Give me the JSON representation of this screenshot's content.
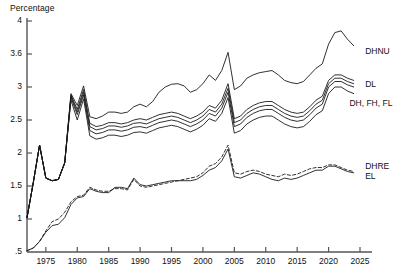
{
  "chart_data": {
    "type": "line",
    "title": "Percentage",
    "xlabel": "",
    "ylabel": "Percentage",
    "grid": false,
    "legend_position": "right-inline",
    "xlim": [
      1972,
      2025
    ],
    "ylim": [
      0.5,
      4.0
    ],
    "y_scale": "non-linear (equal pixel spacing per labelled tick)",
    "yticks": [
      0.5,
      1,
      1.5,
      2,
      2.5,
      3,
      3.6,
      4
    ],
    "ytick_labels": [
      ".5",
      "1",
      "1.5",
      "2",
      "2.5",
      "3",
      "3.6",
      "4"
    ],
    "xticks": [
      1975,
      1980,
      1985,
      1990,
      1995,
      2000,
      2005,
      2010,
      2015,
      2020,
      2025
    ],
    "xtick_labels": [
      "1975",
      "1980",
      "1985",
      "1990",
      "1995",
      "2000",
      "2005",
      "2010",
      "2015",
      "2020",
      "2025"
    ],
    "x": [
      1972,
      1973,
      1974,
      1975,
      1976,
      1977,
      1978,
      1979,
      1980,
      1981,
      1982,
      1983,
      1984,
      1985,
      1986,
      1987,
      1988,
      1989,
      1990,
      1991,
      1992,
      1993,
      1994,
      1995,
      1996,
      1997,
      1998,
      1999,
      2000,
      2001,
      2002,
      2003,
      2004,
      2005,
      2006,
      2007,
      2008,
      2009,
      2010,
      2011,
      2012,
      2013,
      2014,
      2015,
      2016,
      2017,
      2018,
      2019,
      2020,
      2021,
      2022,
      2023,
      2024
    ],
    "series": [
      {
        "name": "DHNU",
        "label": "DHNU",
        "style": "solid",
        "values": [
          1.02,
          1.55,
          2.12,
          1.62,
          1.58,
          1.6,
          1.85,
          2.9,
          2.72,
          3.02,
          2.55,
          2.52,
          2.56,
          2.62,
          2.62,
          2.6,
          2.62,
          2.7,
          2.74,
          2.7,
          2.78,
          2.92,
          3.0,
          3.05,
          3.06,
          3.02,
          2.92,
          2.96,
          3.06,
          3.22,
          3.12,
          3.3,
          3.62,
          2.96,
          3.02,
          3.16,
          3.22,
          3.26,
          3.28,
          3.3,
          3.22,
          3.12,
          3.08,
          3.06,
          3.1,
          3.22,
          3.34,
          3.42,
          3.72,
          3.86,
          3.88,
          3.78,
          3.7
        ]
      },
      {
        "name": "DL",
        "label": "DL",
        "style": "solid",
        "values": [
          1.02,
          1.55,
          2.12,
          1.62,
          1.58,
          1.6,
          1.85,
          2.88,
          2.66,
          2.96,
          2.45,
          2.4,
          2.42,
          2.46,
          2.46,
          2.44,
          2.46,
          2.5,
          2.52,
          2.5,
          2.54,
          2.58,
          2.6,
          2.62,
          2.6,
          2.56,
          2.52,
          2.56,
          2.62,
          2.72,
          2.68,
          2.8,
          3.06,
          2.52,
          2.56,
          2.66,
          2.72,
          2.76,
          2.78,
          2.78,
          2.72,
          2.66,
          2.62,
          2.6,
          2.62,
          2.7,
          2.8,
          2.86,
          3.12,
          3.22,
          3.22,
          3.16,
          3.12
        ]
      },
      {
        "name": "DH",
        "label": "DH, FH, FL",
        "style": "solid",
        "values": [
          1.02,
          1.55,
          2.12,
          1.62,
          1.58,
          1.6,
          1.85,
          2.86,
          2.62,
          2.92,
          2.4,
          2.35,
          2.37,
          2.41,
          2.41,
          2.39,
          2.41,
          2.45,
          2.46,
          2.44,
          2.48,
          2.52,
          2.54,
          2.56,
          2.54,
          2.5,
          2.46,
          2.5,
          2.56,
          2.66,
          2.62,
          2.74,
          2.98,
          2.46,
          2.5,
          2.6,
          2.66,
          2.7,
          2.72,
          2.72,
          2.66,
          2.6,
          2.56,
          2.54,
          2.56,
          2.64,
          2.74,
          2.8,
          3.06,
          3.16,
          3.16,
          3.1,
          3.06
        ]
      },
      {
        "name": "FH",
        "label": "",
        "style": "solid",
        "values": [
          1.02,
          1.55,
          2.12,
          1.62,
          1.58,
          1.6,
          1.85,
          2.84,
          2.58,
          2.88,
          2.34,
          2.29,
          2.31,
          2.35,
          2.35,
          2.33,
          2.35,
          2.39,
          2.4,
          2.38,
          2.42,
          2.46,
          2.48,
          2.5,
          2.48,
          2.44,
          2.4,
          2.44,
          2.5,
          2.6,
          2.56,
          2.68,
          2.92,
          2.4,
          2.44,
          2.54,
          2.6,
          2.64,
          2.66,
          2.66,
          2.6,
          2.54,
          2.5,
          2.48,
          2.5,
          2.58,
          2.68,
          2.74,
          3.0,
          3.1,
          3.1,
          3.04,
          3.0
        ]
      },
      {
        "name": "FL",
        "label": "",
        "style": "solid",
        "values": [
          1.02,
          1.55,
          2.12,
          1.62,
          1.58,
          1.6,
          1.85,
          2.8,
          2.5,
          2.82,
          2.26,
          2.21,
          2.23,
          2.27,
          2.27,
          2.25,
          2.27,
          2.31,
          2.32,
          2.3,
          2.34,
          2.38,
          2.4,
          2.42,
          2.4,
          2.36,
          2.32,
          2.36,
          2.42,
          2.52,
          2.48,
          2.6,
          2.84,
          2.3,
          2.34,
          2.44,
          2.5,
          2.54,
          2.56,
          2.56,
          2.5,
          2.44,
          2.4,
          2.38,
          2.4,
          2.48,
          2.58,
          2.64,
          2.9,
          3.0,
          3.0,
          2.94,
          2.9
        ]
      },
      {
        "name": "DHRE",
        "label": "DHRE",
        "style": "solid",
        "values": [
          0.52,
          0.56,
          0.66,
          0.8,
          0.9,
          0.92,
          1.02,
          1.22,
          1.32,
          1.34,
          1.46,
          1.42,
          1.4,
          1.4,
          1.48,
          1.48,
          1.46,
          1.62,
          1.52,
          1.5,
          1.52,
          1.54,
          1.56,
          1.58,
          1.58,
          1.58,
          1.58,
          1.6,
          1.66,
          1.74,
          1.78,
          1.88,
          2.06,
          1.64,
          1.62,
          1.66,
          1.7,
          1.68,
          1.64,
          1.6,
          1.58,
          1.62,
          1.6,
          1.62,
          1.66,
          1.7,
          1.74,
          1.74,
          1.8,
          1.8,
          1.76,
          1.72,
          1.7
        ]
      },
      {
        "name": "EL",
        "label": "EL",
        "style": "dashed",
        "values": [
          0.52,
          0.56,
          0.66,
          0.82,
          0.96,
          1.0,
          1.1,
          1.26,
          1.34,
          1.36,
          1.48,
          1.44,
          1.42,
          1.42,
          1.46,
          1.46,
          1.44,
          1.6,
          1.5,
          1.48,
          1.5,
          1.52,
          1.54,
          1.56,
          1.58,
          1.6,
          1.62,
          1.64,
          1.7,
          1.8,
          1.84,
          1.94,
          2.12,
          1.7,
          1.68,
          1.72,
          1.74,
          1.72,
          1.68,
          1.66,
          1.64,
          1.68,
          1.66,
          1.68,
          1.72,
          1.76,
          1.78,
          1.78,
          1.82,
          1.82,
          1.78,
          1.74,
          1.72
        ]
      }
    ],
    "series_labels": [
      {
        "text": "DHNU",
        "x": 2025.5,
        "y": 3.63
      },
      {
        "text": "DL",
        "x": 2025.5,
        "y": 3.03
      },
      {
        "text": "DH, FH, FL",
        "x": 2023.0,
        "y": 2.74
      },
      {
        "text": "DHRE",
        "x": 2025.5,
        "y": 1.79
      },
      {
        "text": "EL",
        "x": 2025.5,
        "y": 1.63
      }
    ]
  },
  "style": {
    "line_color": "#1a1a1a",
    "axis_color": "#555555",
    "text_color": "#111111",
    "background": "#ffffff"
  }
}
